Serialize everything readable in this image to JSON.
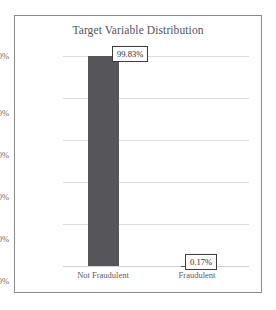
{
  "chart_data": {
    "type": "bar",
    "title": "Target Variable Distribution",
    "xlabel": "",
    "ylabel": "",
    "categories": [
      "Not Fraudulent",
      "Fraudulent"
    ],
    "values": [
      99.83,
      0.17
    ],
    "value_labels": [
      "99.83%",
      "0.17%"
    ],
    "ylim": [
      0,
      100
    ],
    "yticks": [
      0,
      20,
      40,
      60,
      80,
      100
    ],
    "ytick_labels": [
      "0%",
      "20%",
      "40%",
      "60%",
      "80%",
      "100%"
    ],
    "grid": true,
    "legend": false,
    "bar_color": "#56565a",
    "grid_color": "#dededf",
    "title_color": "#54545a",
    "frame_color": "#8b8b8f",
    "label_box_border_color": "#3c3c40"
  }
}
